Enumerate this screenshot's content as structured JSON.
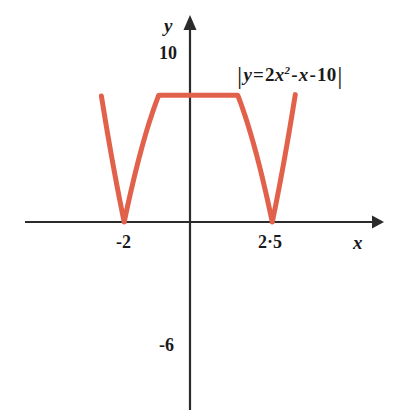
{
  "figure": {
    "kind": "cartesian-graph",
    "background_color": "#ffffff"
  },
  "axes": {
    "x_name": "x",
    "y_name": "y",
    "axis_color": "#2b2b2b",
    "origin_px": {
      "x": 190,
      "y": 222
    },
    "px_per_unit_x": 32.9,
    "px_per_unit_y": 17.5
  },
  "ticks": {
    "y_10": "10",
    "y_neg6": "-6",
    "x_neg2": "-2",
    "x_2p5": "2·5"
  },
  "equation": {
    "open_bar": "|",
    "lhs": "y",
    "equals": "=",
    "coef": "2",
    "x_var": "x",
    "power": "2",
    "minus_1": "-",
    "x_var_2": "x",
    "minus_2": "-",
    "constant": "10",
    "close_bar": "|",
    "plain_text": "|y = 2x² - x - 10|"
  },
  "chart_data": {
    "type": "line",
    "title": "",
    "xlabel": "x",
    "ylabel": "y",
    "curve_color": "#E2614B",
    "curve_width_px": 5,
    "xlim": [
      -3.45,
      4.0
    ],
    "ylim": [
      -12.0,
      11.5
    ],
    "grid": false,
    "legend": null,
    "annotations": [
      {
        "text": "|y = 2x² - x - 10|",
        "x": 1.4,
        "y": 8.3
      }
    ],
    "xticks": [
      -2,
      2.5
    ],
    "xticklabels": [
      "-2",
      "2·5"
    ],
    "yticks": [
      10,
      -6
    ],
    "yticklabels": [
      "10",
      "-6"
    ],
    "series": [
      {
        "name": "|y = 2x^2 - x - 10|",
        "expression": "abs(2*x^2 - x - 10)",
        "roots": [
          -2,
          2.5
        ],
        "local_max": {
          "x": 0.25,
          "y": 10.125
        },
        "x": [
          -3.45,
          -3.2,
          -3.0,
          -2.8,
          -2.6,
          -2.4,
          -2.2,
          -2.0,
          -1.8,
          -1.6,
          -1.4,
          -1.2,
          -1.0,
          -0.8,
          -0.6,
          -0.4,
          -0.2,
          0.0,
          0.25,
          0.5,
          0.75,
          1.0,
          1.25,
          1.5,
          1.75,
          2.0,
          2.25,
          2.5,
          2.75,
          3.0,
          3.2,
          3.45,
          3.95
        ],
        "y": [
          17.2,
          13.7,
          11.0,
          8.5,
          6.1,
          3.9,
          1.9,
          0.0,
          1.7,
          3.2,
          4.5,
          5.6,
          6.5,
          7.2,
          7.7,
          8.1,
          8.3,
          8.3,
          8.1,
          8.0,
          7.6,
          7.0,
          6.2,
          5.2,
          4.1,
          2.8,
          1.4,
          0.0,
          2.4,
          5.0,
          7.0,
          10.0,
          15.4
        ]
      }
    ]
  }
}
